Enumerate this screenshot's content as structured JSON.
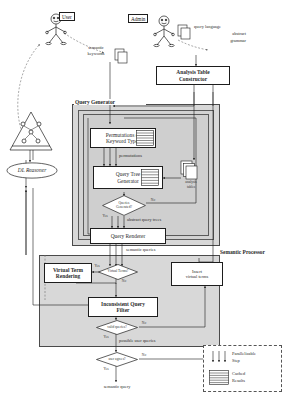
{
  "diagram": {
    "actors": [
      {
        "id": "user",
        "label": "User",
        "name": "actor-user"
      },
      {
        "id": "admin",
        "label": "Admin",
        "name": "actor-admin"
      }
    ],
    "artifacts": {
      "semantic_keywords": "semantic\nkeywords",
      "semantic_keywords_line1": "semantic",
      "semantic_keywords_line2": "keywords",
      "query_language_l1": "query language",
      "query_language_l2": "abstract",
      "query_language_l3": "grammar",
      "analysis_tables_l1": "analysis",
      "analysis_tables_l2": "tables",
      "ontology": "ontology"
    },
    "containers": [
      {
        "id": "query_generator",
        "label": "Query Generator"
      },
      {
        "id": "semantic_processor",
        "label": "Semantic Processor"
      }
    ],
    "boxes": [
      {
        "id": "analysis_table_constructor",
        "l1": "Analysis Table",
        "l2": "Constructor",
        "bold": true
      },
      {
        "id": "permutations",
        "l1": "Permutations of",
        "l2": "Keyword Types",
        "bold": false
      },
      {
        "id": "query_tree_generator",
        "l1": "Query Tree",
        "l2": "Generator",
        "bold": false
      },
      {
        "id": "query_renderer",
        "l1": "Query Renderer",
        "l2": "",
        "bold": false
      },
      {
        "id": "virtual_term_rendering",
        "l1": "Virtual Term",
        "l2": "Rendering",
        "bold": true
      },
      {
        "id": "inconsistent_query_filter",
        "l1": "Inconsistent Query",
        "l2": "Filter",
        "bold": true
      },
      {
        "id": "insert_virtual_terms",
        "l1": "Insert",
        "l2": "virtual terms",
        "bold": false
      },
      {
        "id": "dl_reasoner",
        "l1": "DL Reasoner",
        "l2": "",
        "bold": false
      }
    ],
    "decisions": [
      {
        "id": "queries_generated",
        "l1": "Queries",
        "l2": "Generated?",
        "yes": "Yes",
        "no": "No"
      },
      {
        "id": "virtual_terms",
        "l1": "Virtual Terms?",
        "l2": "",
        "yes": "Yes",
        "no": "No"
      },
      {
        "id": "valid_queries",
        "l1": "valid queries?",
        "l2": "",
        "yes": "Yes",
        "no": "No"
      },
      {
        "id": "user_agrees",
        "l1": "user agrees?",
        "l2": "",
        "yes": "Yes",
        "no": "No"
      }
    ],
    "edge_labels": [
      {
        "id": "permutations_label",
        "text": "permutations"
      },
      {
        "id": "abstract_query_trees_label",
        "text": "abstract query trees"
      },
      {
        "id": "semantic_queries_label",
        "text": "semantic queries"
      },
      {
        "id": "possible_user_queries_label",
        "text": "possible user queries"
      },
      {
        "id": "semantic_query_output",
        "text": "semantic query"
      }
    ],
    "legend": {
      "items": [
        {
          "id": "parallelizable",
          "l1": "Parallelizable",
          "l2": "Step",
          "symbol": "parallel-arrows"
        },
        {
          "id": "cached",
          "l1": "Cached",
          "l2": "Results",
          "symbol": "cached-stack"
        }
      ]
    }
  }
}
